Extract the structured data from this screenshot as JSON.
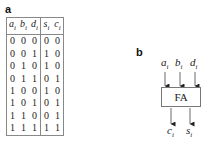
{
  "panel_a": {
    "label": "a",
    "headers": [
      {
        "var": "a",
        "sub": "i"
      },
      {
        "var": "b",
        "sub": "i"
      },
      {
        "var": "d",
        "sub": "i"
      },
      {
        "var": "s",
        "sub": "i"
      },
      {
        "var": "c",
        "sub": "i"
      }
    ],
    "rows": [
      [
        "0",
        "0",
        "0",
        "0",
        "0"
      ],
      [
        "0",
        "0",
        "1",
        "1",
        "0"
      ],
      [
        "0",
        "1",
        "0",
        "1",
        "0"
      ],
      [
        "0",
        "1",
        "1",
        "0",
        "1"
      ],
      [
        "1",
        "0",
        "0",
        "1",
        "0"
      ],
      [
        "1",
        "0",
        "1",
        "0",
        "1"
      ],
      [
        "1",
        "1",
        "0",
        "0",
        "1"
      ],
      [
        "1",
        "1",
        "1",
        "1",
        "1"
      ]
    ]
  },
  "panel_b": {
    "label": "b",
    "block_label": "FA",
    "inputs": [
      {
        "var": "a",
        "sub": "i"
      },
      {
        "var": "b",
        "sub": "i"
      },
      {
        "var": "d",
        "sub": "i"
      }
    ],
    "outputs": [
      {
        "var": "c",
        "sub": "i"
      },
      {
        "var": "s",
        "sub": "i"
      }
    ]
  }
}
